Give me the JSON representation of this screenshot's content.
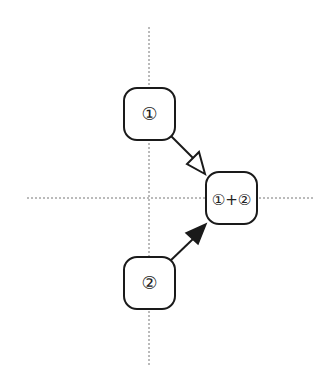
{
  "diagram": {
    "nodes": [
      {
        "id": "node1",
        "label": "①",
        "x": 124,
        "y": 88,
        "w": 51,
        "h": 52
      },
      {
        "id": "node2",
        "label": "②",
        "x": 124,
        "y": 257,
        "w": 51,
        "h": 52
      },
      {
        "id": "node3",
        "label": "①+②",
        "x": 206,
        "y": 172,
        "w": 51,
        "h": 52
      }
    ],
    "edges": [
      {
        "from": "node1",
        "to": "node3",
        "arrowhead": "open-triangle"
      },
      {
        "from": "node2",
        "to": "node3",
        "arrowhead": "filled-triangle"
      }
    ],
    "axes": {
      "vertical": {
        "x": 149,
        "y1": 27,
        "y2": 366,
        "style": "dashed"
      },
      "horizontal": {
        "y": 198,
        "x1": 27,
        "x2": 314,
        "style": "dashed"
      }
    },
    "colors": {
      "stroke": "#1a1a1a",
      "axis": "#777777",
      "background": "#ffffff"
    }
  }
}
